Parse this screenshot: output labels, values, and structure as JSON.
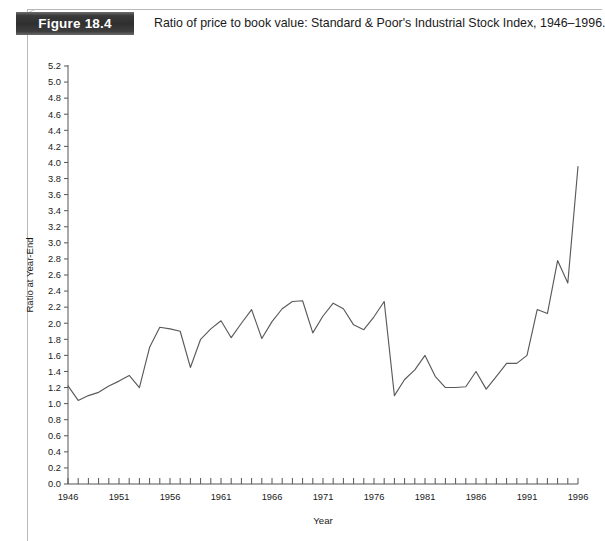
{
  "figure": {
    "badge_label": "Figure 18.4",
    "caption": "Ratio of price to book value: Standard & Poor's Industrial Stock Index, 1946–1996."
  },
  "chart_data": {
    "type": "line",
    "title": "Ratio of price to book value: Standard & Poor's Industrial Stock Index, 1946–1996.",
    "xlabel": "Year",
    "ylabel": "Ratio at Year-End",
    "xlim": [
      1946,
      1996
    ],
    "ylim": [
      0.0,
      5.2
    ],
    "ytick_step": 0.2,
    "xtick_step": 1,
    "xtick_label_step": 5,
    "grid": false,
    "legend": null,
    "line_color": "#5a5a5a",
    "ytick_labels": [
      "0.0",
      "0.2",
      "0.4",
      "0.6",
      "0.8",
      "1.0",
      "1.2",
      "1.4",
      "1.6",
      "1.8",
      "2.0",
      "2.2",
      "2.4",
      "2.6",
      "2.8",
      "3.0",
      "3.2",
      "3.4",
      "3.6",
      "3.8",
      "4.0",
      "4.2",
      "4.4",
      "4.6",
      "4.8",
      "5.0",
      "5.2"
    ],
    "xtick_labels": [
      "1946",
      "1951",
      "1956",
      "1961",
      "1966",
      "1971",
      "1976",
      "1981",
      "1986",
      "1991",
      "1996"
    ],
    "x": [
      1946,
      1947,
      1948,
      1949,
      1950,
      1951,
      1952,
      1953,
      1954,
      1955,
      1956,
      1957,
      1958,
      1959,
      1960,
      1961,
      1962,
      1963,
      1964,
      1965,
      1966,
      1967,
      1968,
      1969,
      1970,
      1971,
      1972,
      1973,
      1974,
      1975,
      1976,
      1977,
      1978,
      1979,
      1980,
      1981,
      1982,
      1983,
      1984,
      1985,
      1986,
      1987,
      1988,
      1989,
      1990,
      1991,
      1992,
      1993,
      1994,
      1995,
      1996
    ],
    "values": [
      1.22,
      1.04,
      1.1,
      1.14,
      1.22,
      1.28,
      1.35,
      1.2,
      1.7,
      1.95,
      1.93,
      1.9,
      1.45,
      1.8,
      1.93,
      2.03,
      1.82,
      2.0,
      2.17,
      1.81,
      2.02,
      2.18,
      2.27,
      2.28,
      1.88,
      2.09,
      2.25,
      2.18,
      1.98,
      1.92,
      2.08,
      2.27,
      1.1,
      1.3,
      1.42,
      1.6,
      1.34,
      1.2,
      1.2,
      1.21,
      1.4,
      1.18,
      1.34,
      1.5,
      1.5,
      1.6,
      2.17,
      2.12,
      2.78,
      2.5,
      3.95
    ],
    "series": [
      {
        "name": "Price to book value ratio",
        "points": [
          [
            1946,
            1.22
          ],
          [
            1947,
            1.04
          ],
          [
            1948,
            1.1
          ],
          [
            1949,
            1.14
          ],
          [
            1950,
            1.22
          ],
          [
            1951,
            1.28
          ],
          [
            1952,
            1.35
          ],
          [
            1953,
            1.2
          ],
          [
            1954,
            1.7
          ],
          [
            1955,
            1.95
          ],
          [
            1956,
            1.93
          ],
          [
            1957,
            1.9
          ],
          [
            1958,
            1.45
          ],
          [
            1959,
            1.8
          ],
          [
            1960,
            1.93
          ],
          [
            1961,
            2.03
          ],
          [
            1962,
            1.82
          ],
          [
            1963,
            2.0
          ],
          [
            1964,
            2.17
          ],
          [
            1965,
            1.81
          ],
          [
            1966,
            2.02
          ],
          [
            1967,
            2.18
          ],
          [
            1968,
            2.27
          ],
          [
            1969,
            2.28
          ],
          [
            1970,
            1.88
          ],
          [
            1971,
            2.09
          ],
          [
            1972,
            2.25
          ],
          [
            1973,
            2.18
          ],
          [
            1974,
            1.98
          ],
          [
            1975,
            1.92
          ],
          [
            1976,
            2.08
          ],
          [
            1977,
            2.27
          ],
          [
            1978,
            1.1
          ],
          [
            1979,
            1.3
          ],
          [
            1980,
            1.42
          ],
          [
            1981,
            1.6
          ],
          [
            1982,
            1.34
          ],
          [
            1983,
            1.2
          ],
          [
            1984,
            1.2
          ],
          [
            1985,
            1.21
          ],
          [
            1986,
            1.4
          ],
          [
            1987,
            1.18
          ],
          [
            1988,
            1.34
          ],
          [
            1989,
            1.5
          ],
          [
            1990,
            1.5
          ],
          [
            1991,
            1.6
          ],
          [
            1992,
            2.17
          ],
          [
            1993,
            2.12
          ],
          [
            1994,
            2.78
          ],
          [
            1995,
            2.5
          ],
          [
            1996,
            3.95
          ]
        ]
      }
    ],
    "note_shape": "Value falls from 1.22 in 1946 to a 1947 low near 1.04, climbs irregularly to roughly 2.28 by 1969, oscillates in the 1.9-2.3 band through 1977, collapses to about 1.10, stays between 1.2 and 1.6 until the mid-1980s, then rises sharply, peaking near 3.95 in 1994, dipping to about 3.60 in 1995 and spiking to roughly 5.15 in 1996."
  }
}
